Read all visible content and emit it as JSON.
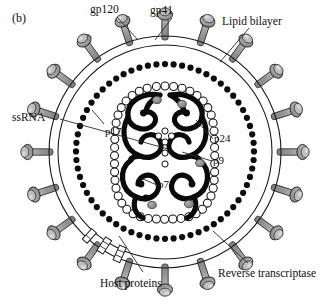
{
  "figure": {
    "panel_label": "(b)"
  },
  "labels": {
    "gp120": "gp120",
    "gp41": "gp41",
    "lipid_bilayer": "Lipid bilayer",
    "ssrna": "ssRNA",
    "p17": "p17",
    "p24": "p24",
    "p9": "p9",
    "p7": "p7",
    "host_proteins": "Host proteins",
    "reverse_transcriptase": "Reverse transcriptase"
  },
  "colors": {
    "line": "#101010",
    "spike_fill": "#9b9b9b",
    "spike_highlight": "#c9c9c9",
    "spike_shadow": "#777777",
    "bead_matrix": "#0d0d0d",
    "bead_capsid_fill": "#ffffff",
    "rna": "#0a0a0a",
    "enzyme_fill": "#8a8a8a",
    "background": "#fefefe",
    "leader": "#303030"
  },
  "structure": {
    "envelope_rings": 2,
    "spike_count": 20,
    "matrix_bead_count": 64,
    "capsid_bead_count": 48,
    "host_protein_count": 3,
    "enzyme_count": 5,
    "nucleocapsid_dot_count": 4
  }
}
